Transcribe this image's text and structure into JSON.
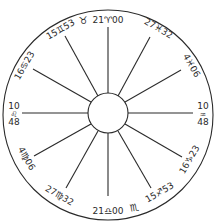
{
  "chart": {
    "type": "horoscope-house-wheel",
    "colors": {
      "line": "#2a2a2a",
      "background": "#ffffff"
    },
    "cusps": [
      {
        "house": 10,
        "label": "21♈00",
        "degree": "21",
        "sign": "Aries",
        "glyph": "♈",
        "minutes": "00"
      },
      {
        "house": 11,
        "label": "27♓32",
        "degree": "27",
        "sign": "Pisces",
        "glyph": "♓",
        "minutes": "32"
      },
      {
        "house": 12,
        "label": "4♓06",
        "degree": "4",
        "sign": "Pisces",
        "glyph": "♓",
        "minutes": "06"
      },
      {
        "house": 1,
        "label_top": "10",
        "glyph": "♒",
        "label_bottom": "48",
        "sign": "Aquarius"
      },
      {
        "house": 2,
        "label": "16♑23",
        "degree": "16",
        "sign": "Capricorn",
        "glyph": "♑",
        "minutes": "23"
      },
      {
        "house": 3,
        "label": "15♐53",
        "degree": "15",
        "sign": "Sagittarius",
        "glyph": "♐",
        "minutes": "53"
      },
      {
        "house": 4,
        "label": "21♎00",
        "degree": "21",
        "sign": "Libra",
        "glyph": "♎",
        "minutes": "00"
      },
      {
        "house": 5,
        "label": "27♍32",
        "degree": "27",
        "sign": "Virgo",
        "glyph": "♍",
        "minutes": "32"
      },
      {
        "house": 6,
        "label": "4♍06",
        "degree": "4",
        "sign": "Virgo",
        "glyph": "♍",
        "minutes": "06"
      },
      {
        "house": 7,
        "label_top": "10",
        "glyph": "♌",
        "label_bottom": "48",
        "sign": "Leo"
      },
      {
        "house": 8,
        "label": "16♋23",
        "degree": "16",
        "sign": "Cancer",
        "glyph": "♋",
        "minutes": "23"
      },
      {
        "house": 9,
        "label": "15♊53",
        "degree": "15",
        "sign": "Gemini",
        "glyph": "♊",
        "minutes": "53"
      }
    ],
    "intercepted": [
      {
        "sign": "Taurus",
        "glyph": "♉"
      },
      {
        "sign": "Scorpio",
        "glyph": "♏"
      }
    ]
  }
}
